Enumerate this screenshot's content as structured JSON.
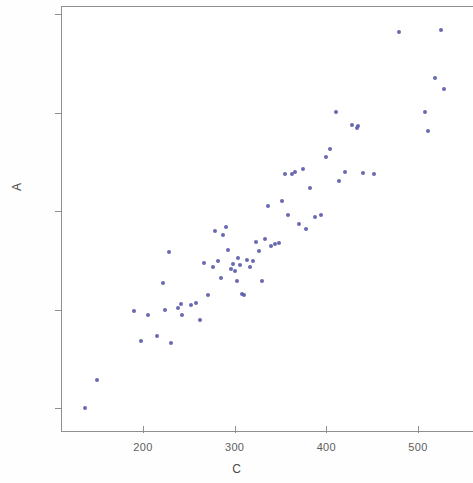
{
  "chart_data": {
    "type": "scatter",
    "title": "",
    "xlabel": "C",
    "ylabel": "A",
    "xlim": [
      128,
      577
    ],
    "ylim": [
      80,
      507
    ],
    "xticks": [
      200,
      300,
      400,
      500
    ],
    "yticks": [
      100,
      200,
      300,
      400,
      500
    ],
    "grid": false,
    "legend": null,
    "marker": {
      "shape": "circle",
      "color": "#5c5cab",
      "size": 4
    },
    "series": [
      {
        "name": "A vs C",
        "points": [
          [
            137,
            100
          ],
          [
            150,
            128
          ],
          [
            190,
            198
          ],
          [
            198,
            168
          ],
          [
            205,
            194
          ],
          [
            215,
            173
          ],
          [
            222,
            227
          ],
          [
            224,
            200
          ],
          [
            228,
            258
          ],
          [
            231,
            166
          ],
          [
            238,
            202
          ],
          [
            241,
            206
          ],
          [
            243,
            194
          ],
          [
            252,
            205
          ],
          [
            258,
            207
          ],
          [
            262,
            189
          ],
          [
            267,
            247
          ],
          [
            271,
            215
          ],
          [
            276,
            243
          ],
          [
            279,
            280
          ],
          [
            282,
            249
          ],
          [
            285,
            232
          ],
          [
            287,
            276
          ],
          [
            290,
            284
          ],
          [
            293,
            260
          ],
          [
            296,
            241
          ],
          [
            298,
            246
          ],
          [
            300,
            239
          ],
          [
            302,
            229
          ],
          [
            304,
            252
          ],
          [
            306,
            245
          ],
          [
            308,
            216
          ],
          [
            310,
            215
          ],
          [
            313,
            250
          ],
          [
            317,
            243
          ],
          [
            320,
            249
          ],
          [
            323,
            269
          ],
          [
            327,
            259
          ],
          [
            330,
            229
          ],
          [
            333,
            272
          ],
          [
            336,
            305
          ],
          [
            340,
            264
          ],
          [
            344,
            266
          ],
          [
            348,
            268
          ],
          [
            352,
            310
          ],
          [
            355,
            338
          ],
          [
            358,
            296
          ],
          [
            362,
            338
          ],
          [
            366,
            340
          ],
          [
            370,
            287
          ],
          [
            374,
            343
          ],
          [
            378,
            282
          ],
          [
            382,
            323
          ],
          [
            388,
            294
          ],
          [
            394,
            296
          ],
          [
            400,
            355
          ],
          [
            404,
            363
          ],
          [
            410,
            401
          ],
          [
            414,
            330
          ],
          [
            420,
            340
          ],
          [
            428,
            387
          ],
          [
            433,
            384
          ],
          [
            435,
            386
          ],
          [
            440,
            339
          ],
          [
            452,
            338
          ],
          [
            479,
            482
          ],
          [
            508,
            401
          ],
          [
            511,
            381
          ],
          [
            518,
            435
          ],
          [
            525,
            484
          ],
          [
            528,
            424
          ]
        ]
      }
    ]
  },
  "axes": {
    "y_tick_labels": [
      "500",
      "400",
      "300",
      "200",
      "100"
    ],
    "x_tick_labels": [
      "200",
      "300",
      "400",
      "500"
    ],
    "y_axis_title": "A",
    "x_axis_title": "C"
  }
}
